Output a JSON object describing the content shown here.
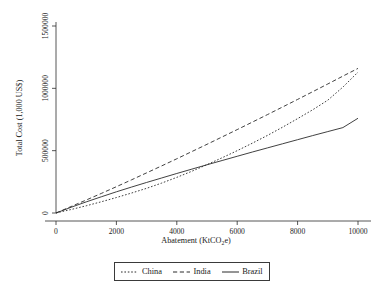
{
  "chart_data": {
    "type": "line",
    "title": "",
    "xlabel": "Abatement (KtCO2e)",
    "xlabel_main": "Abatement (KtCO",
    "xlabel_sub": "2",
    "xlabel_tail": "e)",
    "ylabel": "Total Cost (1,000 US$)",
    "xlim": [
      0,
      10000
    ],
    "ylim": [
      0,
      1600000
    ],
    "grid": false,
    "legend_position": "bottom-center-boxed",
    "xticks": [
      0,
      2000,
      4000,
      6000,
      8000,
      10000
    ],
    "xticklabels": [
      "0",
      "2000",
      "4000",
      "6000",
      "8000",
      "10000"
    ],
    "yticks": [
      0,
      500000,
      1000000,
      1500000
    ],
    "yticklabels": [
      "0",
      "500000",
      "1000000",
      "1500000"
    ],
    "series": [
      {
        "name": "China",
        "style": "dotted",
        "color": "#2b2b2b",
        "x": [
          0,
          500,
          1000,
          1500,
          2000,
          2500,
          3000,
          3500,
          4000,
          4500,
          5000,
          5500,
          6000,
          6500,
          7000,
          7500,
          8000,
          8500,
          9000,
          9500,
          10000
        ],
        "y": [
          0,
          28000,
          58000,
          90000,
          124000,
          160000,
          198000,
          240000,
          286000,
          335000,
          388000,
          443000,
          500000,
          560000,
          622000,
          688000,
          757000,
          828000,
          905000,
          1010000,
          1130000
        ]
      },
      {
        "name": "India",
        "style": "dashed",
        "color": "#2b2b2b",
        "x": [
          0,
          500,
          1000,
          1500,
          2000,
          2500,
          3000,
          3500,
          4000,
          4500,
          5000,
          5500,
          6000,
          6500,
          7000,
          7500,
          8000,
          8500,
          9000,
          9500,
          10000
        ],
        "y": [
          0,
          52000,
          104000,
          157000,
          211000,
          266000,
          322000,
          378000,
          435000,
          493000,
          551000,
          610000,
          669000,
          729000,
          789000,
          850000,
          911000,
          973000,
          1035000,
          1098000,
          1160000
        ]
      },
      {
        "name": "Brazil",
        "style": "solid",
        "color": "#2b2b2b",
        "x": [
          0,
          500,
          1000,
          1500,
          2000,
          2500,
          3000,
          3500,
          4000,
          4500,
          5000,
          5500,
          6000,
          6500,
          7000,
          7500,
          8000,
          8500,
          9000,
          9500,
          10000
        ],
        "y": [
          0,
          46000,
          89000,
          130000,
          170000,
          208000,
          245000,
          281000,
          317000,
          352000,
          387000,
          421000,
          455000,
          489000,
          522000,
          555000,
          588000,
          621000,
          653000,
          685000,
          760000
        ]
      }
    ]
  },
  "legend": {
    "items": [
      {
        "label": "China"
      },
      {
        "label": "India"
      },
      {
        "label": "Brazil"
      }
    ]
  }
}
